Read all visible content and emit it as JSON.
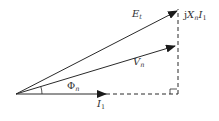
{
  "diagram": {
    "type": "phasor-diagram",
    "colors": {
      "line": "#2a2a2a",
      "text": "#333333",
      "background": "#ffffff"
    },
    "origin": {
      "x": 16,
      "y": 94
    },
    "vectors": [
      {
        "id": "Et",
        "label_main": "E",
        "label_sub": "t",
        "tip": {
          "x": 177,
          "y": 11
        }
      },
      {
        "id": "Vn",
        "label_main": "V",
        "label_sub": "n",
        "tip": {
          "x": 175,
          "y": 46
        }
      },
      {
        "id": "I1",
        "label_main": "I",
        "label_sub": "1",
        "tip": {
          "x": 106,
          "y": 94
        }
      }
    ],
    "angle": {
      "symbol": "Φ",
      "sub": "n"
    },
    "drop": {
      "prefix": "j",
      "main1": "X",
      "sub1": "n",
      "main2": "I",
      "sub2": "1"
    }
  }
}
